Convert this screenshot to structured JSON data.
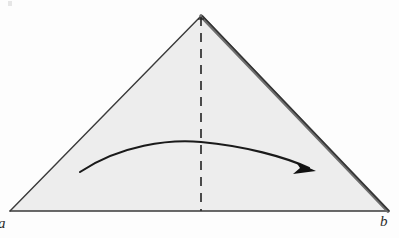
{
  "figure": {
    "background_color": "#fdfdfd",
    "paper_fill_color": "#ededed",
    "outline_color": "#3a3a3a",
    "fold_edge_color": "#555555",
    "dashed_line_color": "#2e2e2e",
    "arrow_color": "#1a1a1a",
    "labels": {
      "left_vertex": "a",
      "right_vertex": "b"
    },
    "geometry": {
      "apex": [
        201,
        16
      ],
      "bottom_left": [
        10,
        211
      ],
      "bottom_right": [
        388,
        211
      ],
      "crease_line": {
        "type": "dashed-vertical",
        "from": [
          201,
          16
        ],
        "to": [
          201,
          211
        ]
      },
      "motion_arrow": {
        "type": "curved-arrow",
        "direction": "left-to-right",
        "start": [
          80,
          172
        ],
        "peak": [
          201,
          142
        ],
        "end": [
          312,
          169
        ]
      },
      "fold_edge": {
        "side": "right",
        "from": [
          201,
          16
        ],
        "to": [
          388,
          211
        ]
      }
    }
  }
}
